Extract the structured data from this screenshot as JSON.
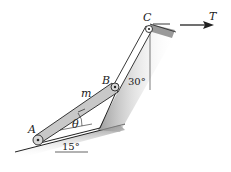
{
  "diagram": {
    "type": "mechanics-linkage",
    "labels": {
      "point_a": "A",
      "point_b": "B",
      "point_c": "C",
      "mass": "m",
      "theta": "θ",
      "tension": "T",
      "angle_ground": "15°",
      "angle_vertical": "30°"
    },
    "colors": {
      "bar_fill": "#c8c8c8",
      "line": "#222222",
      "shade": "#9a9a9a"
    }
  }
}
